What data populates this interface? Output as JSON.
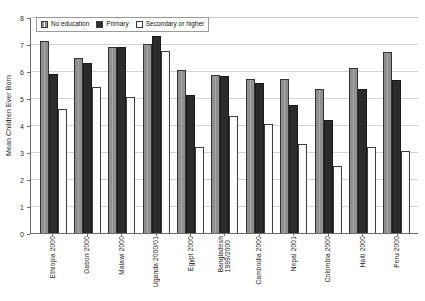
{
  "chart_data": {
    "type": "bar",
    "title": "",
    "xlabel": "",
    "ylabel": "Mean Children Ever Born",
    "ylim": [
      0,
      8
    ],
    "yticks": [
      0,
      1,
      2,
      3,
      4,
      5,
      6,
      7,
      8
    ],
    "grid": true,
    "legend_position": "top-left",
    "categories": [
      "Ethiopia 2000",
      "Gabon 2000",
      "Malawi 2000",
      "Uganda 2000/01",
      "Egypt 2000",
      "Bangladesh 1999/2000",
      "Cambodia 2000",
      "Nepal 2001",
      "Colombia 2000",
      "Haiti 2000",
      "Peru 2000"
    ],
    "series": [
      {
        "name": "No education",
        "color": "#8f8f8f",
        "values": [
          7.1,
          6.5,
          6.9,
          7.0,
          6.05,
          5.85,
          5.7,
          5.7,
          5.35,
          6.1,
          6.7
        ]
      },
      {
        "name": "Primary",
        "color": "#2b2b2b",
        "values": [
          5.9,
          6.3,
          6.9,
          7.3,
          5.1,
          5.8,
          5.55,
          4.75,
          4.2,
          5.35,
          5.65
        ]
      },
      {
        "name": "Secondary or higher",
        "color": "#ffffff",
        "values": [
          4.6,
          5.4,
          5.05,
          6.75,
          3.2,
          4.35,
          4.05,
          3.3,
          2.5,
          3.2,
          3.05
        ]
      }
    ]
  }
}
